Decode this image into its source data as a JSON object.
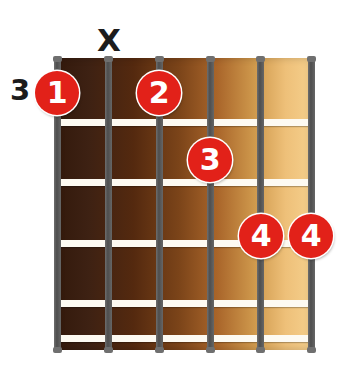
{
  "diagram": {
    "type": "guitar-chord-diagram",
    "starting_fret_label": "3",
    "string_count": 6,
    "fret_count": 5,
    "colors": {
      "dot_fill": "#e22119",
      "dot_text": "#ffffff",
      "string": "#5a5a5a",
      "fret": "#fdfaf2",
      "label_text": "#1c1c1c",
      "board_dark": "#33190c",
      "board_light": "#f5cf8c",
      "background": "#ffffff"
    }
  },
  "string_markers": [
    {
      "string": 1,
      "symbol": "",
      "state": "none"
    },
    {
      "string": 2,
      "symbol": "X",
      "state": "muted"
    },
    {
      "string": 3,
      "symbol": "",
      "state": "none"
    },
    {
      "string": 4,
      "symbol": "",
      "state": "none"
    },
    {
      "string": 5,
      "symbol": "",
      "state": "none"
    },
    {
      "string": 6,
      "symbol": "",
      "state": "none"
    }
  ],
  "finger_dots": [
    {
      "finger": "1",
      "string": 1,
      "fret": 1,
      "x": 57,
      "y": 93
    },
    {
      "finger": "2",
      "string": 3,
      "fret": 1,
      "x": 159,
      "y": 93
    },
    {
      "finger": "3",
      "string": 4,
      "fret": 2,
      "x": 210,
      "y": 160
    },
    {
      "finger": "4",
      "string": 5,
      "fret": 4,
      "x": 261,
      "y": 236
    },
    {
      "finger": "4",
      "string": 6,
      "fret": 4,
      "x": 311,
      "y": 236
    }
  ],
  "strings_x": [
    57,
    108,
    159,
    210,
    260,
    311
  ],
  "frets_y": [
    122,
    182,
    243,
    303,
    338
  ]
}
